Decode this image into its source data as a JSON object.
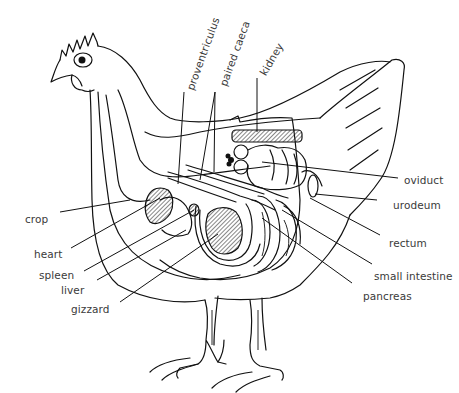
{
  "diagram": {
    "colors": {
      "ink": "#111111",
      "label": "#3a3a3a",
      "background": "#ffffff"
    },
    "labels": {
      "proventriculus": "proventriculus",
      "paired_caeca": "paired caeca",
      "kidney": "kidney",
      "oviduct": "oviduct",
      "urodeum": "urodeum",
      "rectum": "rectum",
      "small_intestine": "small intestine",
      "pancreas": "pancreas",
      "crop": "crop",
      "heart": "heart",
      "spleen": "spleen",
      "liver": "liver",
      "gizzard": "gizzard"
    }
  }
}
